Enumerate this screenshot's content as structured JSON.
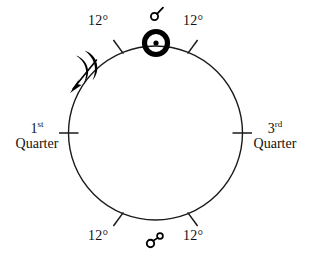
{
  "diagram": {
    "circle": {
      "center_x": 155.5,
      "center_y": 133,
      "radius": 87,
      "stroke": "#1a1a1a",
      "stroke_width": 1.4
    },
    "ink_color": "#111111",
    "labels": {
      "degree_top_left": "12°",
      "degree_top_right": "12°",
      "degree_bottom_left": "12°",
      "degree_bottom_right": "12°",
      "first_quarter_ordinal": "1",
      "first_quarter_ordinal_suffix": "st",
      "first_quarter_word": "Quarter",
      "third_quarter_ordinal": "3",
      "third_quarter_ordinal_suffix": "rd",
      "third_quarter_word": "Quarter"
    },
    "symbols": {
      "conjunction": "☌",
      "conjunction_name": "conjunction-symbol",
      "sun": "☉",
      "sun_name": "sun-symbol",
      "moon": "☽",
      "moon_name": "crescent-moon-symbol",
      "opposition": "☍",
      "opposition_name": "opposition-symbol"
    },
    "tick_marks": [
      {
        "name": "tick-top-left",
        "angle_deg": -115,
        "label": "12°"
      },
      {
        "name": "tick-top-right",
        "angle_deg": -65,
        "label": "12°"
      },
      {
        "name": "tick-left",
        "angle_deg": 180,
        "label": "1st Quarter"
      },
      {
        "name": "tick-right",
        "angle_deg": 0,
        "label": "3rd Quarter"
      },
      {
        "name": "tick-bottom-left",
        "angle_deg": 115,
        "label": "12°"
      },
      {
        "name": "tick-bottom-right",
        "angle_deg": 65,
        "label": "12°"
      }
    ],
    "motion": {
      "direction": "counterclockwise",
      "arrow_name": "moon-motion-arrow"
    }
  }
}
